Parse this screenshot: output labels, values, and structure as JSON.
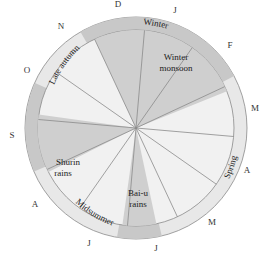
{
  "diagram": {
    "type": "circular-calendar",
    "center": [
      136,
      128
    ],
    "outer_radius": 111,
    "inner_radius": 98,
    "colors": {
      "background": "#ffffff",
      "light_fill": "#f1f1f1",
      "ring_light": "#e8e8e8",
      "shaded_fill": "#cfcfcf",
      "ring_shaded": "#c8c8c8",
      "line": "#8a8a8a"
    },
    "months": [
      {
        "label": "D",
        "angle": -10
      },
      {
        "label": "J",
        "angle": 20
      },
      {
        "label": "F",
        "angle": 50
      },
      {
        "label": "M",
        "angle": 80
      },
      {
        "label": "A",
        "angle": 110
      },
      {
        "label": "M",
        "angle": 140
      },
      {
        "label": "J",
        "angle": 170
      },
      {
        "label": "J",
        "angle": 200
      },
      {
        "label": "A",
        "angle": 230
      },
      {
        "label": "S",
        "angle": 260
      },
      {
        "label": "O",
        "angle": 290
      },
      {
        "label": "N",
        "angle": 320
      }
    ],
    "spoke_angles": [
      5,
      35,
      65,
      95,
      125,
      155,
      185,
      215,
      245,
      275,
      305,
      335
    ],
    "seasons": [
      {
        "label": "Winter",
        "shaded": true,
        "start": -30,
        "end": 62
      },
      {
        "label": "Spring",
        "shaded": false,
        "start": 62,
        "end": 168
      },
      {
        "label": "Midsummer",
        "shaded": false,
        "start": 195,
        "end": 240
      },
      {
        "label": "Late autumn",
        "shaded": false,
        "start": 285,
        "end": 330
      }
    ],
    "rains": [
      {
        "label_lines": [
          "Winter",
          "monsoon"
        ],
        "start": -25,
        "end": 68
      },
      {
        "label_lines": [
          "Bai-u",
          "rains"
        ],
        "start": 168,
        "end": 192
      },
      {
        "label_lines": [
          "Shurin",
          "rains"
        ],
        "start": 243,
        "end": 282
      }
    ]
  },
  "labels": {
    "winter": "Winter",
    "spring": "Spring",
    "midsummer": "Midsummer",
    "late_autumn": "Late autumn",
    "winter_monsoon_1": "Winter",
    "winter_monsoon_2": "monsoon",
    "baiu_1": "Bai-u",
    "baiu_2": "rains",
    "shurin_1": "Shurin",
    "shurin_2": "rains",
    "m_d": "D",
    "m_j1": "J",
    "m_f": "F",
    "m_m1": "M",
    "m_a1": "A",
    "m_m2": "M",
    "m_j2": "J",
    "m_j3": "J",
    "m_a2": "A",
    "m_s": "S",
    "m_o": "O",
    "m_n": "N"
  }
}
